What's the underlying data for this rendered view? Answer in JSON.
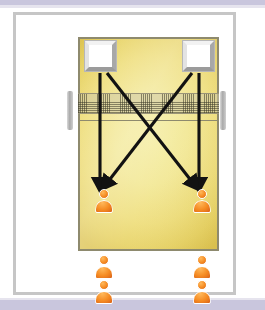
{
  "figure": {
    "title": "Volleyball drill diagram: cross and straight spike approach",
    "frame_border_color": "#c6c6c6",
    "page_band_color": "#c9c6dd",
    "background_color": "#ffffff"
  },
  "court": {
    "name": "volleyball-court",
    "fill_color_center": "#f4ec9e",
    "fill_color_edge": "#ddc452",
    "line_color": "#8e8a6e",
    "net": {
      "name": "net",
      "mesh_color": "#3c3a28",
      "band_color": "#cec8a8",
      "post_color": "#a9a9a9",
      "posts": [
        "left-post",
        "right-post"
      ]
    },
    "attack_line": {
      "name": "attack-line",
      "color": "#8e8a6e"
    }
  },
  "targets": [
    {
      "name": "target-box-left",
      "label": "Target box (left)",
      "fill": "#ffffff"
    },
    {
      "name": "target-box-right",
      "label": "Target box (right)",
      "fill": "#ffffff"
    }
  ],
  "arrows": {
    "color": "#121212",
    "items": [
      {
        "name": "arrow-left-straight",
        "label": "Left box straight down to left player",
        "type": "straight"
      },
      {
        "name": "arrow-right-straight",
        "label": "Right box straight down to right player",
        "type": "straight"
      },
      {
        "name": "arrow-left-cross",
        "label": "Left box diagonal across to right player",
        "type": "cross"
      },
      {
        "name": "arrow-right-cross",
        "label": "Right box diagonal across to left player",
        "type": "cross"
      }
    ]
  },
  "players": {
    "color": "#f58b22",
    "outline": "#ffffff",
    "on_court": [
      {
        "name": "player-court-left",
        "label": "Player on court, left column"
      },
      {
        "name": "player-court-right",
        "label": "Player on court, right column"
      }
    ],
    "queue": [
      {
        "name": "player-queue-left-1",
        "label": "Waiting player, left line, first"
      },
      {
        "name": "player-queue-left-2",
        "label": "Waiting player, left line, second"
      },
      {
        "name": "player-queue-right-1",
        "label": "Waiting player, right line, first"
      },
      {
        "name": "player-queue-right-2",
        "label": "Waiting player, right line, second"
      }
    ]
  }
}
